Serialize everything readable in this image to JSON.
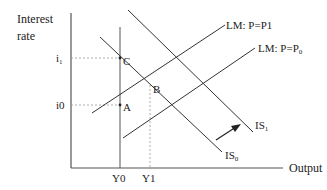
{
  "diagram": {
    "type": "IS-LM diagram",
    "y_axis_label_line1": "Interest",
    "y_axis_label_line2": "rate",
    "x_axis_label": "Output",
    "interest_levels": {
      "i1": "i",
      "i1_sub": "1",
      "i0": "i0"
    },
    "output_levels": {
      "y0": "Y0",
      "y1": "Y1"
    },
    "points": {
      "a": "A",
      "b": "B",
      "c": "C"
    },
    "curves": {
      "lm_p1": "LM: P=P1",
      "lm_p0_main": "LM: P=P",
      "lm_p0_sub": "0",
      "is0_main": "IS",
      "is0_sub": "0",
      "is1_main": "IS",
      "is1_sub": "1"
    },
    "colors": {
      "line": "#333333",
      "dotted": "#999999",
      "text": "#222222"
    }
  }
}
